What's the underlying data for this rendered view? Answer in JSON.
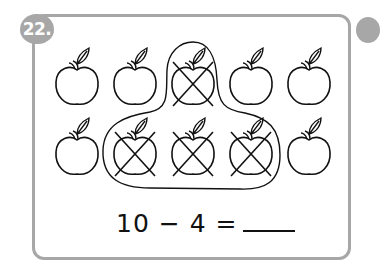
{
  "problem": {
    "number": "22.",
    "equation_text": "10 − 4 =",
    "answer_blank": ""
  },
  "illustration": {
    "icon": "apple-icon",
    "rows": [
      {
        "crossed": [
          false,
          false,
          true,
          false,
          false
        ]
      },
      {
        "crossed": [
          false,
          true,
          true,
          true,
          false
        ]
      }
    ],
    "total": 10,
    "crossed_out": 4
  },
  "colors": {
    "border": "#a7a7a7",
    "ink": "#111111"
  }
}
